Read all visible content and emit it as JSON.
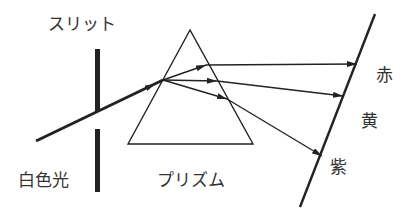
{
  "diagram": {
    "labels": {
      "slit": "スリット",
      "white_light": "白色光",
      "prism": "プリズム",
      "red": "赤",
      "yellow": "黄",
      "violet": "紫"
    },
    "colors": {
      "line": "#222222",
      "text": "#333333",
      "background": "#ffffff"
    }
  }
}
